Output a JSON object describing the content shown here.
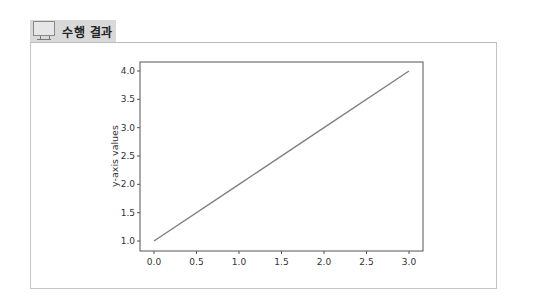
{
  "header": {
    "title": "수행 결과",
    "icon": "monitor-icon"
  },
  "chart_data": {
    "type": "line",
    "title": "",
    "xlabel": "",
    "ylabel": "y-axis values",
    "x": [
      0,
      1,
      2,
      3
    ],
    "series": [
      {
        "name": "line",
        "values": [
          1,
          2,
          3,
          4
        ],
        "color": "#808080"
      }
    ],
    "xlim": [
      -0.15,
      3.15
    ],
    "ylim": [
      0.85,
      4.15
    ],
    "xticks": [
      "0.0",
      "0.5",
      "1.0",
      "1.5",
      "2.0",
      "2.5",
      "3.0"
    ],
    "yticks": [
      "1.0",
      "1.5",
      "2.0",
      "2.5",
      "3.0",
      "3.5",
      "4.0"
    ],
    "grid": false,
    "legend": null
  }
}
